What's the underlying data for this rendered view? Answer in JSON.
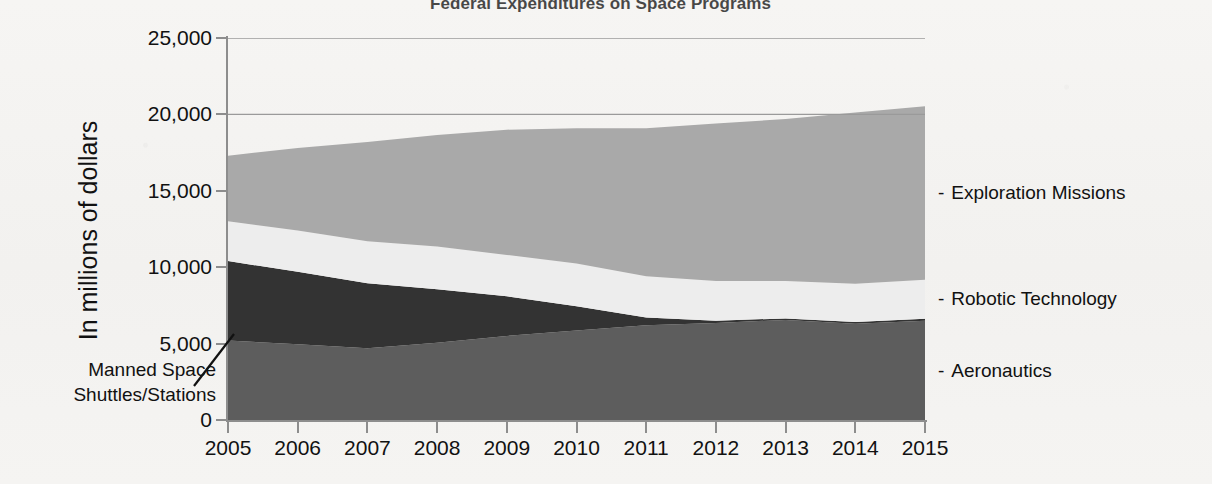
{
  "title": "Federal Expenditures on Space Programs",
  "axes": {
    "y_title": "In millions of dollars",
    "y_ticks": [
      "0",
      "5,000",
      "10,000",
      "15,000",
      "20,000",
      "25,000"
    ],
    "x_ticks": [
      "2005",
      "2006",
      "2007",
      "2008",
      "2009",
      "2010",
      "2011",
      "2012",
      "2013",
      "2014",
      "2015"
    ]
  },
  "callout": {
    "line1": "Manned Space",
    "line2": "Shuttles/Stations"
  },
  "legend": [
    {
      "dash": "-",
      "label": "Exploration Missions",
      "color": "#a9a9a9"
    },
    {
      "dash": "-",
      "label": "Robotic Technology",
      "color": "#ececec"
    },
    {
      "dash": "-",
      "label": "Aeronautics",
      "color": "#3b3b3b"
    }
  ],
  "colors": {
    "manned_space": "#5d5d5d",
    "aeronautics": "#333333",
    "robotic_technology": "#ededed",
    "exploration_missions": "#a9a9a9",
    "axis": "#8d8d8d",
    "gridline": "#9a9a9a",
    "text": "#111111",
    "background": "#f4f3f1"
  },
  "chart_data": {
    "type": "area",
    "stacked": true,
    "title": "Federal Expenditures on Space Programs",
    "xlabel": "",
    "ylabel": "In millions of dollars",
    "ylim": [
      0,
      25000
    ],
    "xlim": [
      2005,
      2015
    ],
    "grid": true,
    "gridlines": [
      20000,
      25000
    ],
    "legend_position": "right",
    "categories": [
      2005,
      2006,
      2007,
      2008,
      2009,
      2010,
      2011,
      2012,
      2013,
      2014,
      2015
    ],
    "series": [
      {
        "name": "Manned Space Shuttles/Stations",
        "color": "#5d5d5d",
        "values": [
          5200,
          4950,
          4700,
          5050,
          5500,
          5850,
          6200,
          6350,
          6550,
          6300,
          6500
        ]
      },
      {
        "name": "Aeronautics",
        "color": "#333333",
        "values": [
          5200,
          4750,
          4250,
          3500,
          2600,
          1600,
          500,
          150,
          100,
          120,
          130
        ]
      },
      {
        "name": "Robotic Technology",
        "color": "#ededed",
        "values": [
          2600,
          2700,
          2750,
          2800,
          2700,
          2800,
          2700,
          2600,
          2450,
          2500,
          2550
        ]
      },
      {
        "name": "Exploration Missions",
        "color": "#a9a9a9",
        "values": [
          4300,
          5400,
          6500,
          7300,
          8200,
          8850,
          9700,
          10300,
          10600,
          11200,
          11350
        ]
      }
    ],
    "cumulative_totals": [
      17300,
      17800,
      18200,
      18650,
      19000,
      19100,
      19100,
      19400,
      19700,
      20120,
      20530
    ]
  }
}
